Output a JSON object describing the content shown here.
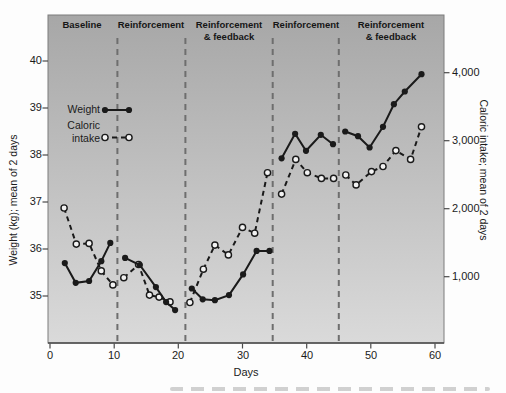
{
  "colors": {
    "plot_bg_top": "#a7a7a7",
    "plot_bg_bottom": "#dadada",
    "boundary_line": "#6e6e6e",
    "axis_line": "#4a4a4a",
    "series_color": "#1a1a1a",
    "open_marker_fill": "#f2f2f2"
  },
  "chart_data": {
    "type": "line",
    "title": "",
    "xlabel": "Days",
    "x_ticks": [
      0,
      10,
      20,
      30,
      40,
      50,
      60
    ],
    "x_range": [
      0,
      61.5
    ],
    "left_axis": {
      "label": "Weight (kg); mean of 2 days",
      "ticks": [
        35,
        36,
        37,
        38,
        39,
        40
      ],
      "range_at_plot_edges": [
        34.0,
        41.0
      ]
    },
    "right_axis": {
      "label": "Caloric intake; mean of 2 days",
      "tick_labels": [
        "1,000",
        "2,000",
        "3,000",
        "4,000"
      ],
      "tick_values": [
        1000,
        2000,
        3000,
        4000
      ],
      "range_at_plot_edges": [
        0,
        4850
      ]
    },
    "grid": "off",
    "legend_position": "upper-left-inside",
    "legend": {
      "weight": "Weight",
      "caloric_line1": "Caloric",
      "caloric_line2": "intake"
    },
    "phases": [
      {
        "lines": [
          "Baseline"
        ],
        "start_day": 0,
        "end_day": 10.5,
        "label_center_day": 5.0
      },
      {
        "lines": [
          "Reinforcement"
        ],
        "start_day": 10.5,
        "end_day": 21.1,
        "label_center_day": 15.8
      },
      {
        "lines": [
          "Reinforcement",
          "& feedback"
        ],
        "start_day": 21.1,
        "end_day": 34.7,
        "label_center_day": 27.9
      },
      {
        "lines": [
          "Reinforcement"
        ],
        "start_day": 34.7,
        "end_day": 45.0,
        "label_center_day": 39.9
      },
      {
        "lines": [
          "Reinforcement",
          "& feedback"
        ],
        "start_day": 45.0,
        "end_day": 61.5,
        "label_center_day": 53.1
      }
    ],
    "phase_boundaries_days": [
      10.5,
      21.1,
      34.7,
      45.0
    ],
    "series": [
      {
        "name": "Weight",
        "axis": "left",
        "units": "kg",
        "line_style": "solid",
        "marker": "filled-circle",
        "color": "#1a1a1a",
        "phases_points": [
          [
            [
              2.3,
              35.7
            ],
            [
              4.0,
              35.28
            ],
            [
              6.1,
              35.32
            ],
            [
              8.0,
              35.74
            ],
            [
              9.4,
              36.13
            ]
          ],
          [
            [
              11.7,
              35.81
            ],
            [
              14.0,
              35.66
            ],
            [
              16.5,
              35.19
            ],
            [
              18.1,
              34.87
            ],
            [
              19.5,
              34.7
            ]
          ],
          [
            [
              22.1,
              35.16
            ],
            [
              23.8,
              34.93
            ],
            [
              25.7,
              34.91
            ],
            [
              27.9,
              35.02
            ],
            [
              30.1,
              35.46
            ],
            [
              32.2,
              35.96
            ],
            [
              34.2,
              35.96
            ]
          ],
          [
            [
              36.1,
              37.93
            ],
            [
              38.2,
              38.45
            ],
            [
              39.9,
              38.09
            ],
            [
              42.2,
              38.43
            ],
            [
              44.1,
              38.23
            ]
          ],
          [
            [
              46.0,
              38.5
            ],
            [
              48.0,
              38.4
            ],
            [
              49.8,
              38.16
            ],
            [
              51.9,
              38.6
            ],
            [
              53.6,
              39.08
            ],
            [
              55.3,
              39.35
            ],
            [
              57.9,
              39.72
            ]
          ]
        ]
      },
      {
        "name": "Caloric intake",
        "axis": "right",
        "units": "calories",
        "line_style": "dashed",
        "marker": "open-circle",
        "color": "#1a1a1a",
        "phases_points": [
          [
            [
              2.2,
              2010
            ],
            [
              4.1,
              1480
            ],
            [
              6.1,
              1490
            ],
            [
              8.0,
              1085
            ],
            [
              9.8,
              880
            ]
          ],
          [
            [
              11.5,
              985
            ],
            [
              13.8,
              1180
            ],
            [
              15.5,
              730
            ],
            [
              17.0,
              700
            ],
            [
              18.7,
              630
            ]
          ],
          [
            [
              21.8,
              620
            ],
            [
              23.9,
              1110
            ],
            [
              25.7,
              1465
            ],
            [
              27.8,
              1320
            ],
            [
              30.0,
              1725
            ],
            [
              31.9,
              1640
            ],
            [
              33.9,
              2530
            ]
          ],
          [
            [
              36.1,
              2215
            ],
            [
              38.3,
              2725
            ],
            [
              40.1,
              2530
            ],
            [
              42.3,
              2445
            ],
            [
              44.2,
              2445
            ]
          ],
          [
            [
              46.1,
              2495
            ],
            [
              47.7,
              2350
            ],
            [
              50.1,
              2545
            ],
            [
              51.9,
              2620
            ],
            [
              53.9,
              2855
            ],
            [
              56.2,
              2725
            ],
            [
              57.9,
              3205
            ]
          ]
        ]
      }
    ]
  }
}
